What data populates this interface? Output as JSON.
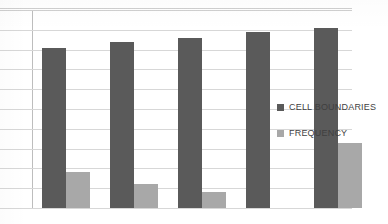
{
  "chart_data": {
    "type": "bar",
    "title": "",
    "subtitle": "",
    "xlabel": "",
    "ylabel": "",
    "categories": [
      "1",
      "2",
      "3",
      "4",
      "5"
    ],
    "series": [
      {
        "name": "CELL BOUNDARIES",
        "color": "#5a5a5a",
        "values": [
          8.1,
          8.4,
          8.6,
          8.9,
          9.1
        ]
      },
      {
        "name": "FREQUENCY",
        "color": "#a8a8a8",
        "values": [
          1.8,
          1.2,
          0.8,
          0,
          3.3
        ]
      }
    ],
    "ylim": [
      0,
      10
    ],
    "yticks": [
      0,
      1,
      2,
      3,
      4,
      5,
      6,
      7,
      8,
      9,
      10
    ],
    "ytick_labels": [],
    "xtick_labels": [],
    "grid": true,
    "grid_axis": "y",
    "grid_color": "#d7d7d7",
    "legend": {
      "position": "inside-right",
      "entries": [
        {
          "label": "CELL BOUNDARIES",
          "color": "#5a5a5a",
          "marker": "square-swatch"
        },
        {
          "label": "FREQUENCY",
          "color": "#a8a8a8",
          "marker": "square-swatch"
        }
      ]
    },
    "background": "#ffffff",
    "axis_color": "#bdbdbd"
  }
}
